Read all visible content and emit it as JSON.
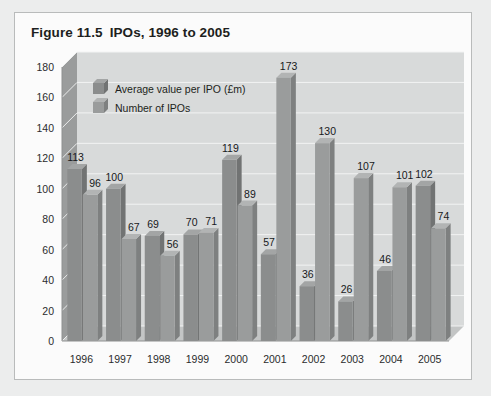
{
  "figure": {
    "number": "Figure 11.5",
    "title": "IPOs, 1996 to 2005"
  },
  "colors": {
    "page_background": "#eceded",
    "panel_background": "#fbfbfb",
    "panel_border": "#b9bbbb",
    "plot_background": "#d8dada",
    "wall_shade": "#9a9c9c",
    "floor_shade": "#c3c5c5",
    "gridline": "#f2f3f3",
    "series1_face": "#8b8d8d",
    "series1_side": "#717373",
    "series1_top": "#a3a5a5",
    "series2_face": "#9a9c9c",
    "series2_side": "#7e8080",
    "series2_top": "#b2b4b4",
    "text": "#1d1f20"
  },
  "chart_data": {
    "type": "bar",
    "title": "IPOs, 1996 to 2005",
    "xlabel": "",
    "ylabel": "",
    "ylim": [
      0,
      180
    ],
    "yticks": [
      0,
      20,
      40,
      60,
      80,
      100,
      120,
      140,
      160,
      180
    ],
    "grid": true,
    "legend_position": "top-left",
    "three_d": true,
    "categories": [
      "1996",
      "1997",
      "1998",
      "1999",
      "2000",
      "2001",
      "2002",
      "2003",
      "2004",
      "2005"
    ],
    "series": [
      {
        "name": "Average value per IPO (£m)",
        "values": [
          113,
          100,
          69,
          70,
          119,
          57,
          36,
          26,
          46,
          102
        ]
      },
      {
        "name": "Number of IPOs",
        "values": [
          96,
          67,
          56,
          71,
          89,
          173,
          130,
          107,
          101,
          74
        ]
      }
    ]
  }
}
